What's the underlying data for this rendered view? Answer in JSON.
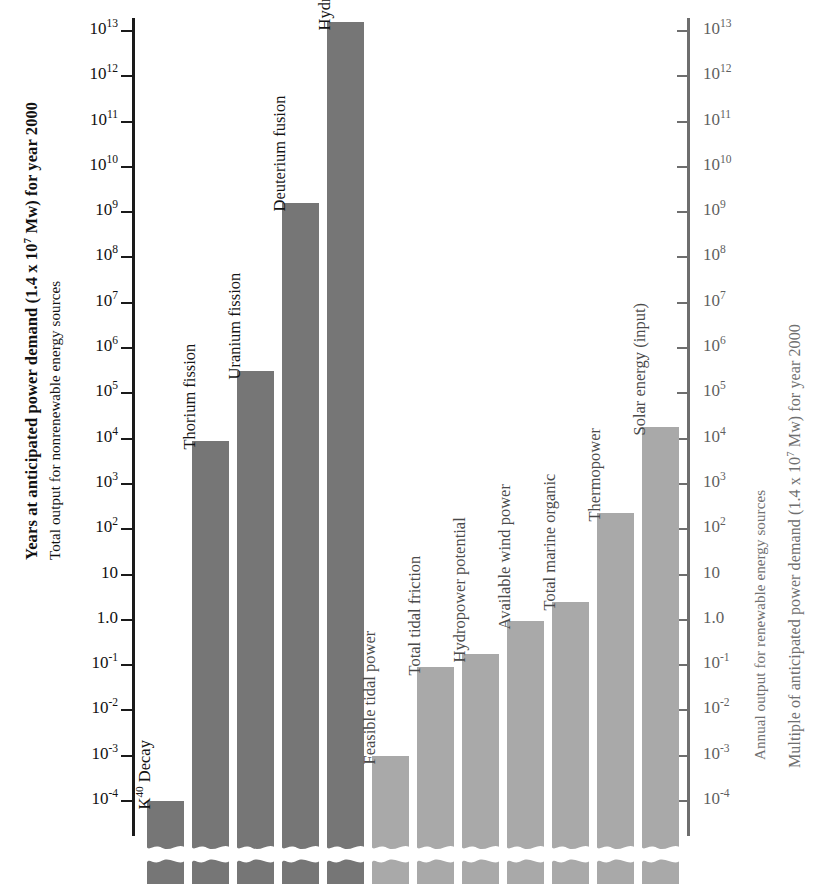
{
  "chart_data": {
    "type": "bar",
    "title": "",
    "scale": "log10",
    "ylim": [
      -4,
      13
    ],
    "grid": false,
    "legend": null,
    "axes": {
      "left": {
        "title_outer": "Years at anticipated power demand (1.4 x 10⁷ Mw) for year 2000",
        "title_outer_parts": {
          "pre": "Years at anticipated power demand (1.4 x 10",
          "sup": "7",
          "post": " Mw) for year 2000"
        },
        "title_inner": "Total output for nonrenewable energy sources",
        "tick_labels": [
          "10¹³",
          "10¹²",
          "10¹¹",
          "10¹⁰",
          "10⁹",
          "10⁸",
          "10⁷",
          "10⁶",
          "10⁵",
          "10⁴",
          "10³",
          "10²",
          "10",
          "1.0",
          "10⁻¹",
          "10⁻²",
          "10⁻³",
          "10⁻⁴"
        ],
        "tick_exponents": [
          "13",
          "12",
          "11",
          "10",
          "9",
          "8",
          "7",
          "6",
          "5",
          "4",
          "3",
          "2",
          "",
          "",
          "-1",
          "-2",
          "-3",
          "-4"
        ],
        "tick_mantissas": [
          "10",
          "10",
          "10",
          "10",
          "10",
          "10",
          "10",
          "10",
          "10",
          "10",
          "10",
          "10",
          "10",
          "1.0",
          "10",
          "10",
          "10",
          "10"
        ],
        "tick_values": [
          13,
          12,
          11,
          10,
          9,
          8,
          7,
          6,
          5,
          4,
          3,
          2,
          1,
          0,
          -1,
          -2,
          -3,
          -4
        ]
      },
      "right": {
        "title_inner": "Annual output for renewable energy sources",
        "title_outer": "Multiple of anticipated power demand (1.4 x 10⁷ Mw) for year 2000",
        "title_outer_parts": {
          "pre": "Multiple of anticipated power demand (1.4 x 10",
          "sup": "7",
          "post": " Mw) for year 2000"
        },
        "tick_mantissas": [
          "10",
          "10",
          "10",
          "10",
          "10",
          "10",
          "10",
          "10",
          "10",
          "10",
          "10",
          "10",
          "10",
          "1.0",
          "10",
          "10",
          "10",
          "10"
        ],
        "tick_exponents": [
          "13",
          "12",
          "11",
          "10",
          "9",
          "8",
          "7",
          "6",
          "5",
          "4",
          "3",
          "2",
          "",
          "",
          "-1",
          "-2",
          "-3",
          "-4"
        ]
      }
    },
    "categories": [
      "K⁴⁰ Decay",
      "Thorium fission",
      "Uranium fission",
      "Deuterium fusion",
      "Hydrogen fusion",
      "Feasible tidal power",
      "Total tidal friction",
      "Hydropower potential",
      "Available wind power",
      "Total marine organic",
      "Thermopower",
      "Solar energy (input)"
    ],
    "values_log10": [
      -4.0,
      3.95,
      5.5,
      9.2,
      13.2,
      -3.0,
      -1.05,
      -0.75,
      -0.03,
      0.4,
      2.35,
      4.25
    ],
    "values": [
      "1e-4",
      "9e3",
      "3e5",
      "1.6e9",
      "1.6e13",
      "1e-3",
      "9e-2",
      "1.8e-1",
      "9.3e-1",
      "2.5",
      "2.2e2",
      "1.8e4"
    ],
    "series_groups": [
      {
        "name": "nonrenewable",
        "indices": [
          0,
          1,
          2,
          3,
          4
        ],
        "color": "#767676"
      },
      {
        "name": "renewable",
        "indices": [
          5,
          6,
          7,
          8,
          9,
          10,
          11
        ],
        "color": "#a9a9a9"
      }
    ],
    "bar_labels": [
      {
        "label": "K⁴⁰ Decay",
        "base": "K",
        "sup": "40",
        "rest": " Decay"
      },
      {
        "label": "Thorium fission"
      },
      {
        "label": "Uranium fission"
      },
      {
        "label": "Deuterium fusion"
      },
      {
        "label": "Hydrogen fusion"
      },
      {
        "label": "Feasible tidal power"
      },
      {
        "label": "Total tidal friction"
      },
      {
        "label": "Hydropower potential"
      },
      {
        "label": "Available wind power"
      },
      {
        "label": "Total marine organic"
      },
      {
        "label": "Thermopower"
      },
      {
        "label": "Solar energy (input)"
      }
    ],
    "colors": {
      "nonrenewable_bar": "#767676",
      "renewable_bar": "#a9a9a9",
      "axis_left": "#1a1a1a",
      "axis_right": "#6e6e6e",
      "background": "#ffffff",
      "label_dark": "#141414",
      "label_light": "#4a4a4a"
    }
  }
}
